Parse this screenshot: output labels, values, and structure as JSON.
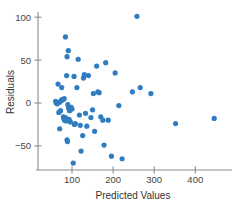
{
  "chart_data": {
    "type": "scatter",
    "title": "",
    "xlabel": "Predicted Values",
    "ylabel": "Residuals",
    "xlim": [
      30,
      470
    ],
    "ylim": [
      -80,
      112
    ],
    "xticks": [
      100,
      200,
      300,
      400
    ],
    "xtick_labels": [
      "100",
      "200",
      "300",
      "400"
    ],
    "yticks": [
      -50,
      0,
      50,
      100
    ],
    "ytick_labels": [
      "−50",
      "0",
      "50",
      "100"
    ],
    "grid": false,
    "legend": null,
    "marker_color": "#2f7cc0",
    "axis_color": "#8d8d8d",
    "marker_size": 2.6,
    "points": [
      [
        60,
        2
      ],
      [
        62,
        0
      ],
      [
        64,
        -1
      ],
      [
        66,
        22
      ],
      [
        68,
        -11
      ],
      [
        70,
        1
      ],
      [
        70,
        -30
      ],
      [
        72,
        -9
      ],
      [
        74,
        3
      ],
      [
        75,
        18
      ],
      [
        76,
        4
      ],
      [
        78,
        4
      ],
      [
        79,
        -16
      ],
      [
        80,
        -18
      ],
      [
        81,
        5
      ],
      [
        82,
        -20
      ],
      [
        83,
        -19
      ],
      [
        84,
        -17
      ],
      [
        84,
        77
      ],
      [
        86,
        -21
      ],
      [
        87,
        32
      ],
      [
        88,
        54
      ],
      [
        88,
        -43
      ],
      [
        89,
        -45
      ],
      [
        90,
        -2
      ],
      [
        91,
        61
      ],
      [
        92,
        -6
      ],
      [
        93,
        -19
      ],
      [
        94,
        -9
      ],
      [
        96,
        -22
      ],
      [
        98,
        -5
      ],
      [
        100,
        -7
      ],
      [
        103,
        -70
      ],
      [
        105,
        31
      ],
      [
        106,
        -25
      ],
      [
        108,
        -24
      ],
      [
        112,
        18
      ],
      [
        115,
        51
      ],
      [
        118,
        -14
      ],
      [
        120,
        -26
      ],
      [
        122,
        -56
      ],
      [
        126,
        -38
      ],
      [
        128,
        29
      ],
      [
        130,
        33
      ],
      [
        133,
        -12
      ],
      [
        136,
        -27
      ],
      [
        140,
        32
      ],
      [
        146,
        -17
      ],
      [
        150,
        -8
      ],
      [
        152,
        11
      ],
      [
        155,
        -33
      ],
      [
        160,
        43
      ],
      [
        163,
        13
      ],
      [
        166,
        12
      ],
      [
        170,
        -16
      ],
      [
        175,
        -20
      ],
      [
        178,
        -49
      ],
      [
        182,
        47
      ],
      [
        188,
        -20
      ],
      [
        196,
        -62
      ],
      [
        205,
        35
      ],
      [
        214,
        -3
      ],
      [
        222,
        -65
      ],
      [
        247,
        13
      ],
      [
        258,
        101
      ],
      [
        266,
        18
      ],
      [
        292,
        11
      ],
      [
        352,
        -24
      ],
      [
        446,
        -18
      ]
    ]
  },
  "axis": {
    "y_title": "Residuals",
    "x_title": "Predicted Values"
  }
}
